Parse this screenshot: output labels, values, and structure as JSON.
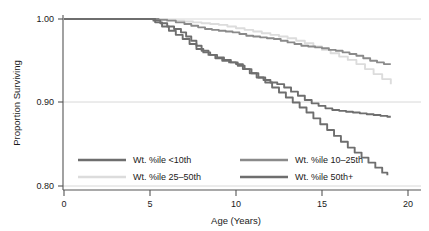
{
  "chart_data": {
    "type": "line",
    "title": "",
    "xlabel": "Age (Years)",
    "ylabel": "Proportion Surviving",
    "xlim": [
      0,
      20
    ],
    "ylim": [
      0.8,
      1.0
    ],
    "xticks": [
      0,
      5,
      10,
      15,
      20
    ],
    "xtick_labels": [
      "0",
      "5",
      "10",
      "15",
      "20"
    ],
    "yticks": [
      0.8,
      0.9,
      1.0
    ],
    "ytick_labels": [
      "0.80",
      "0.90",
      "1.00"
    ],
    "grid": "horizontal gridlines at 0.80, 0.90, 1.00",
    "legend_position": "inside bottom-left, two columns",
    "series": [
      {
        "name": "Wt. %ile <10th",
        "color": "#6e6e6e",
        "x": [
          0,
          4.9,
          5.2,
          5.6,
          6.0,
          6.4,
          6.8,
          7.1,
          7.4,
          7.7,
          8.0,
          8.4,
          8.8,
          9.2,
          9.6,
          10.0,
          10.4,
          10.8,
          11.2,
          11.6,
          12.0,
          12.4,
          12.8,
          13.2,
          13.6,
          14.0,
          14.4,
          14.8,
          15.2,
          15.6,
          16.0,
          16.4,
          16.8,
          17.2,
          17.6,
          18.0,
          18.4,
          18.8,
          19.0
        ],
        "y": [
          1.0,
          1.0,
          0.998,
          0.995,
          0.991,
          0.988,
          0.984,
          0.979,
          0.974,
          0.968,
          0.962,
          0.957,
          0.953,
          0.95,
          0.948,
          0.946,
          0.94,
          0.935,
          0.93,
          0.927,
          0.924,
          0.922,
          0.918,
          0.913,
          0.908,
          0.903,
          0.899,
          0.896,
          0.893,
          0.891,
          0.89,
          0.889,
          0.888,
          0.887,
          0.886,
          0.885,
          0.884,
          0.883,
          0.883
        ]
      },
      {
        "name": "Wt. %ile 10-25th",
        "color": "#8a8a8a",
        "x": [
          0,
          5.0,
          5.5,
          6.0,
          6.5,
          7.0,
          7.4,
          7.8,
          8.2,
          8.6,
          9.0,
          9.4,
          9.8,
          10.2,
          10.6,
          11.0,
          11.4,
          11.8,
          12.2,
          12.6,
          13.0,
          13.4,
          13.8,
          14.2,
          14.6,
          15.0,
          15.4,
          15.8,
          16.2,
          16.6,
          17.0,
          17.4,
          17.8,
          18.2,
          18.6,
          19.0
        ],
        "y": [
          1.0,
          1.0,
          0.999,
          0.998,
          0.996,
          0.994,
          0.992,
          0.99,
          0.988,
          0.987,
          0.986,
          0.985,
          0.984,
          0.982,
          0.98,
          0.979,
          0.978,
          0.977,
          0.976,
          0.974,
          0.972,
          0.97,
          0.968,
          0.967,
          0.966,
          0.965,
          0.963,
          0.962,
          0.96,
          0.958,
          0.956,
          0.953,
          0.95,
          0.948,
          0.946,
          0.946
        ]
      },
      {
        "name": "Wt. %ile 25-50th",
        "color": "#dcdcdc",
        "x": [
          0,
          5.5,
          6.0,
          6.5,
          7.0,
          7.5,
          8.0,
          8.5,
          9.0,
          9.5,
          10.0,
          10.5,
          11.0,
          11.5,
          12.0,
          12.5,
          13.0,
          13.5,
          14.0,
          14.5,
          15.0,
          15.5,
          16.0,
          16.5,
          17.0,
          17.5,
          18.0,
          18.5,
          19.0
        ],
        "y": [
          1.0,
          1.0,
          0.999,
          0.998,
          0.997,
          0.996,
          0.995,
          0.994,
          0.993,
          0.991,
          0.989,
          0.987,
          0.985,
          0.983,
          0.981,
          0.979,
          0.977,
          0.974,
          0.971,
          0.967,
          0.963,
          0.959,
          0.955,
          0.951,
          0.946,
          0.94,
          0.934,
          0.928,
          0.922
        ]
      },
      {
        "name": "Wt. %ile 50th+",
        "color": "#6e6e6e",
        "x": [
          0,
          4.9,
          5.3,
          5.7,
          6.1,
          6.5,
          6.9,
          7.3,
          7.7,
          8.1,
          8.5,
          8.9,
          9.3,
          9.7,
          10.1,
          10.5,
          10.9,
          11.3,
          11.7,
          12.1,
          12.5,
          12.9,
          13.3,
          13.7,
          14.1,
          14.5,
          14.9,
          15.3,
          15.7,
          16.1,
          16.5,
          16.9,
          17.3,
          17.7,
          18.1,
          18.5,
          18.8
        ],
        "y": [
          1.0,
          1.0,
          0.996,
          0.991,
          0.986,
          0.981,
          0.976,
          0.97,
          0.964,
          0.96,
          0.957,
          0.954,
          0.951,
          0.948,
          0.944,
          0.94,
          0.935,
          0.93,
          0.924,
          0.918,
          0.912,
          0.906,
          0.9,
          0.894,
          0.888,
          0.881,
          0.874,
          0.867,
          0.86,
          0.853,
          0.846,
          0.84,
          0.834,
          0.828,
          0.822,
          0.816,
          0.813
        ]
      }
    ],
    "legend": [
      {
        "label": "Wt. %ile <10th",
        "color": "#6e6e6e"
      },
      {
        "label": "Wt. %ile 10–25th",
        "color": "#8a8a8a"
      },
      {
        "label": "Wt. %ile 25–50th",
        "color": "#dcdcdc"
      },
      {
        "label": "Wt. %ile 50th+",
        "color": "#6e6e6e"
      }
    ]
  },
  "axes": {
    "y_title": "Proportion Surviving",
    "x_title": "Age (Years)",
    "y_ticks": [
      "1.00",
      "0.90",
      "0.80"
    ],
    "x_ticks": [
      "0",
      "5",
      "10",
      "15",
      "20"
    ]
  },
  "colors": {
    "axis": "#555555",
    "grid": "#d8d8d8",
    "background": "#ffffff",
    "text": "#1a1a1a"
  }
}
